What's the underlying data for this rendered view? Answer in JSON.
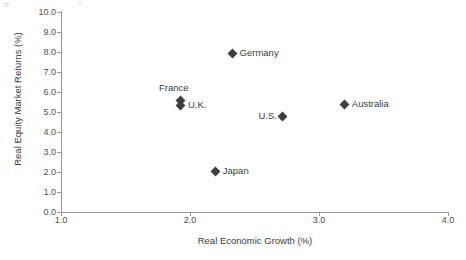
{
  "chart_data": {
    "type": "scatter",
    "title": "",
    "xlabel": "Real Economic Growth (%)",
    "ylabel": "Real Equity Market Returns (%)",
    "xlim": [
      1.0,
      4.0
    ],
    "ylim": [
      0.0,
      10.0
    ],
    "xticks": [
      "1.0",
      "2.0",
      "3.0",
      "4.0"
    ],
    "yticks": [
      "0.0",
      "1.0",
      "2.0",
      "3.0",
      "4.0",
      "5.0",
      "6.0",
      "7.0",
      "8.0",
      "9.0",
      "10.0"
    ],
    "grid": false,
    "legend": "none",
    "marker_color": "#3f3f3f",
    "axis_color": "#9a9a9a",
    "points": [
      {
        "label": "Germany",
        "x": 2.33,
        "y": 7.95,
        "label_position": "right"
      },
      {
        "label": "France",
        "x": 1.93,
        "y": 5.6,
        "label_position": "above"
      },
      {
        "label": "U.K.",
        "x": 1.93,
        "y": 5.35,
        "label_position": "right"
      },
      {
        "label": "U.S.",
        "x": 2.72,
        "y": 4.8,
        "label_position": "left"
      },
      {
        "label": "Australia",
        "x": 3.2,
        "y": 5.4,
        "label_position": "right"
      },
      {
        "label": "Japan",
        "x": 2.2,
        "y": 2.05,
        "label_position": "right"
      }
    ]
  }
}
